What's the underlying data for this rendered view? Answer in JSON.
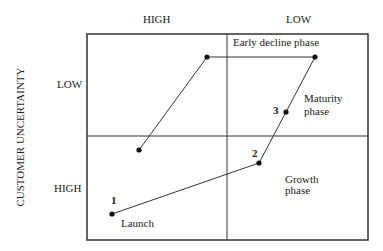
{
  "axes": {
    "top_labels": [
      "HIGH",
      "LOW"
    ],
    "left_labels": [
      "LOW",
      "HIGH"
    ],
    "y_title": "CUSTOMER UNCERTAINTY"
  },
  "phases": {
    "launch": "Launch",
    "growth_line1": "Growth",
    "growth_line2": "phase",
    "maturity_line1": "Maturity",
    "maturity_line2": "phase",
    "early_decline": "Early decline phase"
  },
  "markers": [
    "1",
    "2",
    "3"
  ],
  "path_points": [
    {
      "id": "1",
      "x": 112,
      "y": 214
    },
    {
      "id": "2",
      "x": 259,
      "y": 163
    },
    {
      "id": "3",
      "x": 286,
      "y": 112
    },
    {
      "id": "early-decline-end",
      "x": 315,
      "y": 57
    },
    {
      "id": "decline-left-top",
      "x": 207,
      "y": 57
    },
    {
      "id": "decline-left-bottom",
      "x": 139,
      "y": 150
    }
  ]
}
